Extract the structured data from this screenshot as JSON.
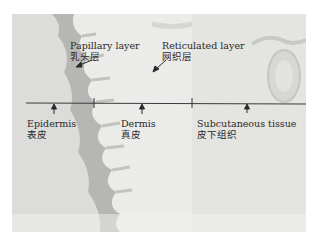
{
  "figure": {
    "background": "#ffffff",
    "tissue_colors": {
      "background": "#e9e9e7",
      "epidermis": "#b4b4b2",
      "epidermis_outer": "#d6d6d4",
      "dermis": "#ecece9",
      "subcutaneous": "#e2e2df",
      "line": "#3a3a3a"
    },
    "labels": {
      "papillary": {
        "en": "Papillary layer",
        "cn": "乳头层"
      },
      "reticulated": {
        "en": "Reticulated layer",
        "cn": "网织层"
      },
      "epidermis": {
        "en": "Epidermis",
        "cn": "表皮"
      },
      "dermis": {
        "en": "Dermis",
        "cn": "真皮"
      },
      "subcutaneous": {
        "en": "Subcutaneous tissue",
        "cn": "皮下组织"
      }
    }
  }
}
